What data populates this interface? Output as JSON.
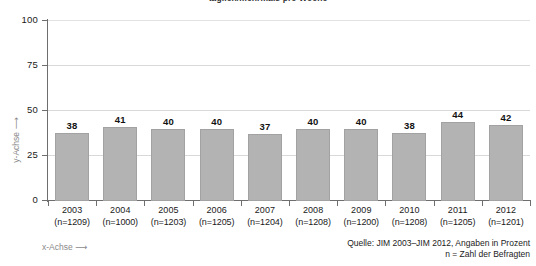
{
  "chart_data": {
    "type": "bar",
    "title": "täglich/mehrmals pro Woche",
    "xlabel": "x-Achse ⟶",
    "ylabel": "y-Achse ⟶",
    "categories": [
      "2003",
      "2004",
      "2005",
      "2006",
      "2007",
      "2008",
      "2009",
      "2010",
      "2011",
      "2012"
    ],
    "category_sublabels": [
      "(n=1209)",
      "(n=1000)",
      "(n=1203)",
      "(n=1205)",
      "(n=1204)",
      "(n=1208)",
      "(n=1200)",
      "(n=1208)",
      "(n=1205)",
      "(n=1201)"
    ],
    "values": [
      38,
      41,
      40,
      40,
      37,
      40,
      40,
      38,
      44,
      42
    ],
    "ylim": [
      0,
      100
    ],
    "yticks": [
      0,
      25,
      50,
      75,
      100
    ],
    "ytick_labels": [
      "0",
      "25",
      "50",
      "75",
      "100"
    ],
    "grid": true,
    "legend": "none",
    "bar_color": "#b3b3b3",
    "bar_border_color": "#a2a2a2",
    "grid_color": "#d9d9d9",
    "axis_color": "#6e6e6e",
    "axis_label_color": "#8a8a8a"
  },
  "source": {
    "line1": "Quelle: JIM 2003–JIM 2012, Angaben in Prozent",
    "line2": "n = Zahl der Befragten"
  }
}
